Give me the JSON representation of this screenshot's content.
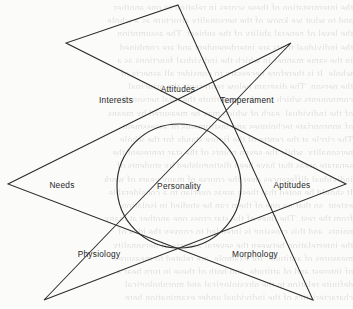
{
  "figure": {
    "name": "personality-star-diagram",
    "shape": "seven-pointed-star-with-inscribed-circle",
    "center_label": "Personality",
    "ink_color": "#2b2b2b",
    "paper_color": "#fbfbfa",
    "bleed_color": "#c9c7c4"
  },
  "labels": [
    {
      "text": "Attitudes",
      "x": 178,
      "y": 89
    },
    {
      "text": "Interests",
      "x": 116,
      "y": 100
    },
    {
      "text": "Temperament",
      "x": 247,
      "y": 100
    },
    {
      "text": "Needs",
      "x": 62,
      "y": 185
    },
    {
      "text": "Personality",
      "x": 179,
      "y": 186
    },
    {
      "text": "Aptitudes",
      "x": 292,
      "y": 185
    },
    {
      "text": "Physiology",
      "x": 99,
      "y": 254
    },
    {
      "text": "Morphology",
      "x": 255,
      "y": 254
    }
  ],
  "geometry": {
    "circle": {
      "cx": 179,
      "cy": 186,
      "r": 62
    },
    "star_points": [
      {
        "name": "top",
        "x": 178,
        "y": 5
      },
      {
        "name": "upper-right",
        "x": 291,
        "y": 43
      },
      {
        "name": "right",
        "x": 346,
        "y": 184
      },
      {
        "name": "lower-right",
        "x": 313,
        "y": 300
      },
      {
        "name": "lower-left",
        "x": 44,
        "y": 300
      },
      {
        "name": "left",
        "x": 8,
        "y": 184
      },
      {
        "name": "upper-left",
        "x": 66,
        "y": 43
      }
    ],
    "star_path": "M 178 5 L 313 300 L 8 184 L 291 43 L 44 300 L 346 184 L 66 43 Z"
  },
  "bleed_text": {
    "lines": [
      "the interpretation of these scores in relation to one another",
      "and to what we know of the personality structure as a whole",
      "the level of general ability of the subject. The assumption",
      "the individual traits are interdependent and are combined",
      "in the same manner in which the individual functions as a",
      "whole. It is therefore necessary to consider all aspects of",
      "the person. The diagram below represents the principal",
      "components which together constitute the total personality",
      "of the individual, each of which may be measured by means",
      "of appropriate techniques and instruments of assessment.",
      "The circle at the centre of the figure stands for the whole",
      "personality, while the seven points of the star represent the",
      "separate areas that have been distinguished by students of",
      "individual differences over the course of many years of work.",
      "It should be noted that these areas overlap to a considerable",
      "extent, so that no one of them can be studied in isolation",
      "from the rest. The lines of the star cross one another at many",
      "points, and this crossing is intended to convey the idea of",
      "the interrelation between the several aspects of personality.",
      "measures of aptitude, for example, are related to measures",
      "of interest and of attitude, and both of these in turn bear a",
      "definite relation to the physiological and morphological",
      "characteristics of the individual under examination here."
    ]
  }
}
